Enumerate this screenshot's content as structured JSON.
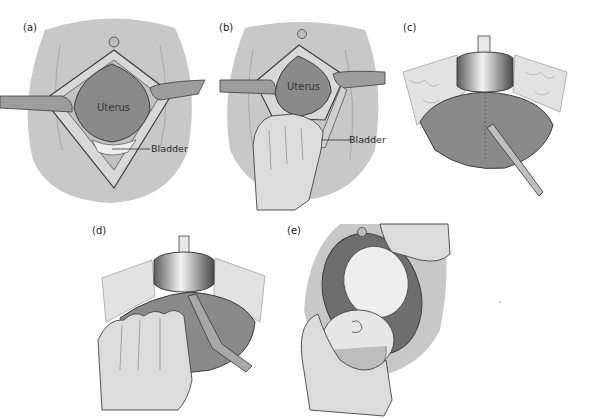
{
  "figure": {
    "background": "#ffffff",
    "colors": {
      "skin_field": "#c8c8c8",
      "uterus": "#8a8a8a",
      "fascia": "#d6d6d6",
      "bladder": "#efefef",
      "retractor": "#9d9d9d",
      "outline": "#3a3a3a",
      "hand": "#dcdcdc",
      "baby": "#eeeeee"
    },
    "panels": [
      {
        "id": "a",
        "label": "(a)",
        "annotations": {
          "organ": "Uterus",
          "callout": "Bladder"
        },
        "description": "Abdominal incision opened with retractors exposing uterus and bladder"
      },
      {
        "id": "b",
        "label": "(b)",
        "annotations": {
          "organ": "Uterus",
          "callout": "Bladder"
        },
        "description": "Hand retracting bladder downward below uterus"
      },
      {
        "id": "c",
        "label": "(c)",
        "annotations": {},
        "description": "Bladder blade in place; scalpel makes transverse lower-segment uterine incision"
      },
      {
        "id": "d",
        "label": "(d)",
        "annotations": {},
        "description": "Fingers and bandage scissors extend the uterine incision laterally"
      },
      {
        "id": "e",
        "label": "(e)",
        "annotations": {},
        "description": "Hand delivers fetal head through the uterine incision"
      }
    ]
  }
}
